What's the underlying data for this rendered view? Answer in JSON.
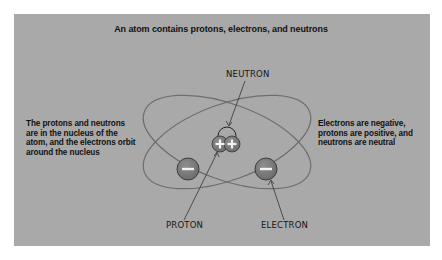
{
  "figure": {
    "title": "An atom contains protons, electrons, and neutrons",
    "left_caption": "The protons and neutrons are in the nucleus of the atom, and the electrons orbit around the nucleus",
    "right_caption": "Electrons are negative, protons are positive, and neutrons are neutral",
    "labels": {
      "neutron": "NEUTRON",
      "proton": "PROTON",
      "electron": "ELECTRON"
    },
    "symbols": {
      "proton_sign": "+",
      "electron_sign": "−"
    },
    "colors": {
      "background_panel": "#a9a9a9",
      "particle_fill": "#7a7a7a",
      "orbit_stroke": "#6e6e6e",
      "sign_color": "#f2f2f2"
    }
  }
}
